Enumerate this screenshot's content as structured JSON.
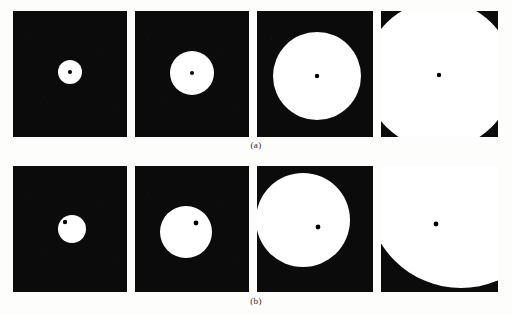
{
  "figure": {
    "background_color": "#fdfdfb",
    "panel_background_color": "#0b0b0b",
    "shape_color": "#ffffff",
    "marker_color": "#000000",
    "rows": [
      {
        "id": "row-a",
        "label": "(a)",
        "label_x": 256,
        "label_y": 140,
        "description": "centered dilation sequence",
        "panels": [
          {
            "name": "panel-a1",
            "x": 13,
            "y": 11,
            "width": 114,
            "height": 126,
            "circle": {
              "cx": 57,
              "cy": 61,
              "r": 12
            },
            "marker": {
              "cx": 57,
              "cy": 61,
              "r": 2
            }
          },
          {
            "name": "panel-a2",
            "x": 135,
            "y": 11,
            "width": 114,
            "height": 126,
            "circle": {
              "cx": 57,
              "cy": 62,
              "r": 22
            },
            "marker": {
              "cx": 57,
              "cy": 62,
              "r": 2
            }
          },
          {
            "name": "panel-a3",
            "x": 257,
            "y": 11,
            "width": 116,
            "height": 126,
            "circle": {
              "cx": 60,
              "cy": 65,
              "r": 44
            },
            "marker": {
              "cx": 60,
              "cy": 65,
              "r": 2.2
            }
          },
          {
            "name": "panel-a4",
            "x": 381,
            "y": 11,
            "width": 117,
            "height": 126,
            "circle": {
              "cx": 58,
              "cy": 64,
              "r": 74
            },
            "marker": {
              "cx": 58,
              "cy": 64,
              "r": 2.2
            }
          }
        ]
      },
      {
        "id": "row-b",
        "label": "(b)",
        "label_x": 256,
        "label_y": 296,
        "description": "off-center dilation sequence, reference point fixed",
        "panels": [
          {
            "name": "panel-b1",
            "x": 13,
            "y": 166,
            "width": 114,
            "height": 126,
            "circle": {
              "cx": 59,
              "cy": 63,
              "r": 14
            },
            "marker": {
              "cx": 52,
              "cy": 56,
              "r": 2.2
            }
          },
          {
            "name": "panel-b2",
            "x": 135,
            "y": 166,
            "width": 114,
            "height": 126,
            "circle": {
              "cx": 51,
              "cy": 66,
              "r": 26
            },
            "marker": {
              "cx": 61,
              "cy": 57,
              "r": 2.4
            }
          },
          {
            "name": "panel-b3",
            "x": 257,
            "y": 166,
            "width": 116,
            "height": 126,
            "circle": {
              "cx": 46,
              "cy": 54,
              "r": 47
            },
            "marker": {
              "cx": 61,
              "cy": 61,
              "r": 2.4
            }
          },
          {
            "name": "panel-b4",
            "x": 381,
            "y": 166,
            "width": 117,
            "height": 126,
            "circle": {
              "cx": 80,
              "cy": 28,
              "r": 94
            },
            "marker": {
              "cx": 55,
              "cy": 58,
              "r": 2.4
            }
          }
        ]
      }
    ]
  }
}
